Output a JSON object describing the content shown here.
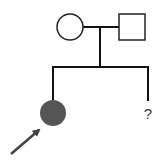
{
  "diagram": {
    "type": "pedigree",
    "parents": [
      {
        "sex": "female",
        "affected": false,
        "shape": "circle"
      },
      {
        "sex": "male",
        "affected": false,
        "shape": "square"
      }
    ],
    "children": [
      {
        "sex": "female",
        "affected": true,
        "proband": true,
        "shape": "circle",
        "fill": "#555555"
      },
      {
        "sex": "unknown",
        "label": "?"
      }
    ],
    "colors": {
      "line": "#111111",
      "affected_fill": "#555555",
      "arrow": "#444444"
    }
  }
}
